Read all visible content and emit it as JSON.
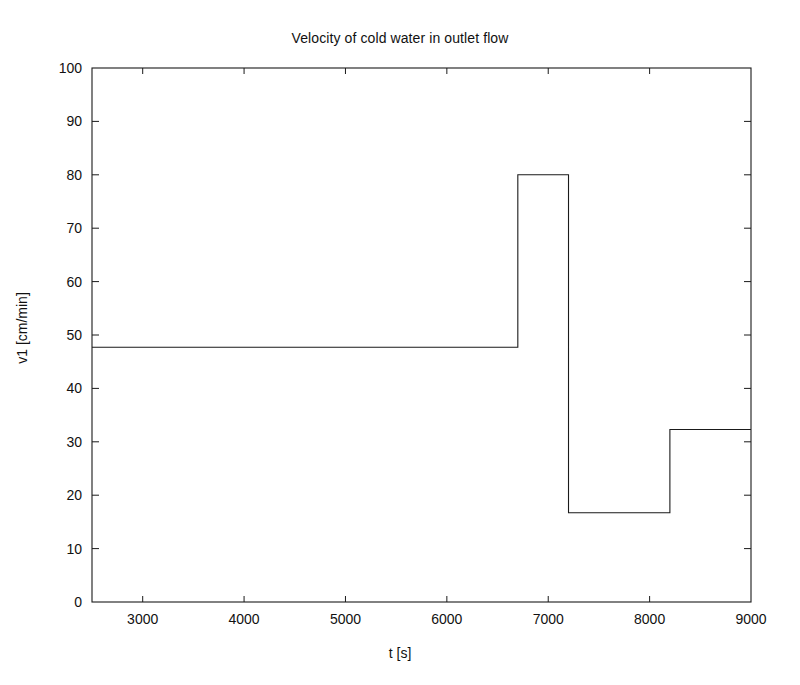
{
  "chart_data": {
    "type": "line",
    "title": "Velocity of cold water in outlet flow",
    "xlabel": "t [s]",
    "ylabel": "v1 [cm/min]",
    "xlim": [
      2500,
      9000
    ],
    "ylim": [
      0,
      100
    ],
    "grid": false,
    "legend": null,
    "line_style": "step-post",
    "line_color": "#1a1a1a",
    "line_width": 1,
    "xticks": [
      3000,
      4000,
      5000,
      6000,
      7000,
      8000,
      9000
    ],
    "xticklabels": [
      "3000",
      "4000",
      "5000",
      "6000",
      "7000",
      "8000",
      "9000"
    ],
    "yticks": [
      0,
      10,
      20,
      30,
      40,
      50,
      60,
      70,
      80,
      90,
      100
    ],
    "yticklabels": [
      "0",
      "10",
      "20",
      "30",
      "40",
      "50",
      "60",
      "70",
      "80",
      "90",
      "100"
    ],
    "x": [
      2500,
      6700,
      7200,
      8200,
      9000
    ],
    "values": [
      47.7,
      80.0,
      16.7,
      32.3,
      32.3
    ],
    "series": [
      {
        "name": "v1",
        "x": [
          2500,
          6700,
          6700,
          7200,
          7200,
          8200,
          8200,
          9000
        ],
        "y": [
          47.7,
          47.7,
          80.0,
          80.0,
          16.7,
          16.7,
          32.3,
          32.3
        ]
      }
    ],
    "segments": [
      {
        "t_start": 2500,
        "t_end": 6700,
        "value": 47.7
      },
      {
        "t_start": 6700,
        "t_end": 7200,
        "value": 80.0
      },
      {
        "t_start": 7200,
        "t_end": 8200,
        "value": 16.7
      },
      {
        "t_start": 8200,
        "t_end": 9000,
        "value": 32.3
      }
    ]
  },
  "figure": {
    "background": "#ffffff",
    "axis_color": "#1a1a1a"
  }
}
